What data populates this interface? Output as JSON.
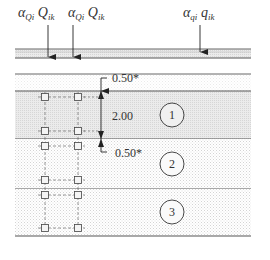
{
  "loads": [
    {
      "id": "point-load-1",
      "symbol": "α",
      "symbol_sub": "Qi",
      "var": "Q",
      "var_sub": "ik",
      "x": 45
    },
    {
      "id": "point-load-2",
      "symbol": "α",
      "symbol_sub": "Qi",
      "var": "Q",
      "var_sub": "ik",
      "x": 72
    },
    {
      "id": "distributed-load",
      "symbol": "α",
      "symbol_sub": "qi",
      "var": "q",
      "var_sub": "ik",
      "x": 200
    }
  ],
  "dimensions": {
    "top_offset": "0.50*",
    "layer_height": "2.00",
    "bottom_offset": "0.50*"
  },
  "layers": [
    {
      "number": "1"
    },
    {
      "number": "2"
    },
    {
      "number": "3"
    }
  ],
  "colors": {
    "line": "#555555",
    "layer1_fill": "#e9e9e9",
    "stipple": "#d8d8d8",
    "text": "#333333"
  }
}
